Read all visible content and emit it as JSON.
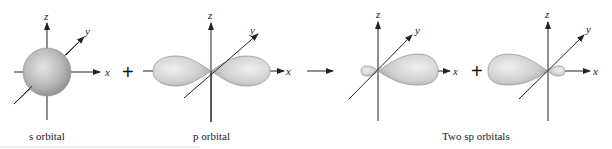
{
  "figure": {
    "panels": [
      {
        "id": "s",
        "caption": "s orbital",
        "axes": {
          "x": "x",
          "y": "y",
          "z": "z"
        }
      },
      {
        "id": "p",
        "caption": "p orbital",
        "axes": {
          "x": "x",
          "y": "y",
          "z": "z"
        }
      },
      {
        "id": "sp1",
        "axes": {
          "x": "x",
          "y": "y",
          "z": "z"
        }
      },
      {
        "id": "sp2",
        "axes": {
          "x": "x",
          "y": "y",
          "z": "z"
        }
      }
    ],
    "sp_caption": "Two sp orbitals",
    "operators": {
      "plus1": "+",
      "plus2": "+"
    },
    "colors": {
      "orbital_fill": "#c4c4c4",
      "orbital_highlight": "#ececec",
      "axis": "#222222"
    }
  }
}
